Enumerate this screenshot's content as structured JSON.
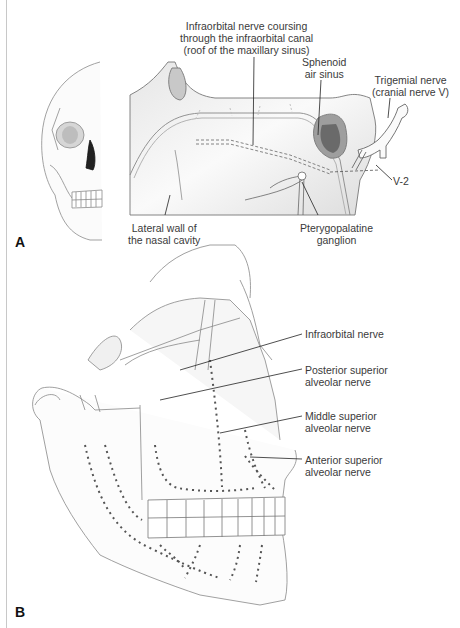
{
  "figure": {
    "panels": [
      {
        "id": "A",
        "letter": "A",
        "labels": {
          "infraorbital_canal": "Infraorbital nerve coursing\nthrough the infraorbital canal\n(roof of the maxillary sinus)",
          "sphenoid": "Sphenoid\nair sinus",
          "trigeminal": "Trigemial nerve\n(cranial nerve V)",
          "v2": "V-2",
          "lateral_wall": "Lateral wall of\nthe nasal cavity",
          "pterygopalatine": "Pterygopalatine\nganglion"
        }
      },
      {
        "id": "B",
        "letter": "B",
        "labels": {
          "infraorbital": "Infraorbital nerve",
          "posterior_superior": "Posterior superior\nalveolar nerve",
          "middle_superior": "Middle superior\nalveolar nerve",
          "anterior_superior": "Anterior superior\nalveolar nerve"
        }
      }
    ]
  }
}
